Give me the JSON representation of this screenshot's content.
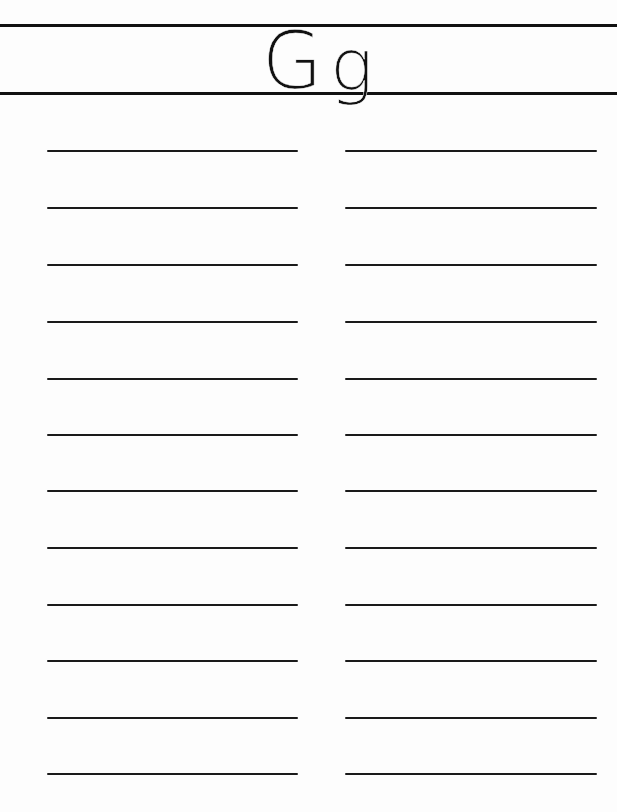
{
  "worksheet": {
    "header": {
      "uppercase_letter": "G",
      "lowercase_letter": "g"
    },
    "writing_lines": {
      "columns": 2,
      "rows_per_column": 12,
      "row_y_positions": [
        150,
        207,
        264,
        321,
        378,
        434,
        490,
        547,
        604,
        660,
        717,
        773
      ]
    },
    "colors": {
      "paper": "#fdfdfd",
      "ink": "#111111"
    }
  }
}
